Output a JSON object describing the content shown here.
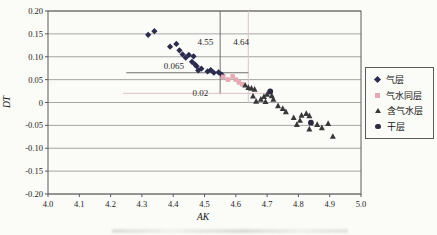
{
  "chart_data": {
    "type": "scatter",
    "title": "",
    "xlabel": "AK",
    "ylabel": "DT",
    "xlim": [
      4.0,
      5.0
    ],
    "ylim": [
      -0.2,
      0.2
    ],
    "grid": "horizontal-only",
    "legend_position": "right-outside-middle",
    "colors": {
      "grid": "#8f8f8f",
      "axis": "#5a5a5a",
      "background": "#fbfbf8"
    },
    "xticks": [
      {
        "v": 4.0,
        "label": "4.0"
      },
      {
        "v": 4.1,
        "label": "4.1"
      },
      {
        "v": 4.2,
        "label": "4.2"
      },
      {
        "v": 4.3,
        "label": "4.3"
      },
      {
        "v": 4.4,
        "label": "4.4"
      },
      {
        "v": 4.5,
        "label": "4.5"
      },
      {
        "v": 4.6,
        "label": "4.6"
      },
      {
        "v": 4.7,
        "label": "4.7"
      },
      {
        "v": 4.8,
        "label": "4.8"
      },
      {
        "v": 4.9,
        "label": "4.9"
      },
      {
        "v": 5.0,
        "label": "5.0"
      }
    ],
    "yticks": [
      {
        "v": 0.2,
        "label": "0.20"
      },
      {
        "v": 0.15,
        "label": "0.15"
      },
      {
        "v": 0.1,
        "label": "0.10"
      },
      {
        "v": 0.05,
        "label": "0.05"
      },
      {
        "v": 0,
        "label": "0"
      },
      {
        "v": -0.05,
        "label": "-0.05"
      },
      {
        "v": -0.1,
        "label": "-0.10"
      },
      {
        "v": -0.15,
        "label": "-0.15"
      },
      {
        "v": -0.2,
        "label": "-0.20"
      }
    ],
    "series": [
      {
        "key": "gas-layer",
        "name": "气层",
        "marker": "diamond",
        "color": "#2b2b4e",
        "points": [
          [
            4.32,
            0.148
          ],
          [
            4.34,
            0.156
          ],
          [
            4.39,
            0.122
          ],
          [
            4.41,
            0.128
          ],
          [
            4.42,
            0.114
          ],
          [
            4.43,
            0.105
          ],
          [
            4.44,
            0.098
          ],
          [
            4.45,
            0.104
          ],
          [
            4.46,
            0.089
          ],
          [
            4.465,
            0.101
          ],
          [
            4.47,
            0.083
          ],
          [
            4.475,
            0.079
          ],
          [
            4.48,
            0.07
          ],
          [
            4.49,
            0.074
          ],
          [
            4.51,
            0.068
          ],
          [
            4.52,
            0.071
          ],
          [
            4.53,
            0.065
          ],
          [
            4.545,
            0.066
          ],
          [
            4.555,
            0.061
          ]
        ]
      },
      {
        "key": "gas-water-same-layer",
        "name": "气水同层",
        "marker": "square",
        "color": "#e5aab1",
        "points": [
          [
            4.56,
            0.056
          ],
          [
            4.575,
            0.05
          ],
          [
            4.59,
            0.057
          ],
          [
            4.6,
            0.05
          ],
          [
            4.61,
            0.044
          ],
          [
            4.62,
            0.04
          ]
        ]
      },
      {
        "key": "gas-bearing-water-layer",
        "name": "含气水层",
        "marker": "triangle",
        "color": "#38383a",
        "points": [
          [
            4.63,
            0.038
          ],
          [
            4.64,
            0.033
          ],
          [
            4.65,
            0.031
          ],
          [
            4.66,
            0.029
          ],
          [
            4.655,
            0.014
          ],
          [
            4.665,
            0.003
          ],
          [
            4.68,
            0.007
          ],
          [
            4.69,
            0.013
          ],
          [
            4.695,
            0.002
          ],
          [
            4.7,
            0.018
          ],
          [
            4.715,
            0.015
          ],
          [
            4.72,
            0.007
          ],
          [
            4.735,
            -0.007
          ],
          [
            4.75,
            -0.013
          ],
          [
            4.76,
            -0.02
          ],
          [
            4.785,
            -0.033
          ],
          [
            4.795,
            -0.048
          ],
          [
            4.805,
            -0.039
          ],
          [
            4.81,
            -0.028
          ],
          [
            4.825,
            -0.024
          ],
          [
            4.835,
            -0.029
          ],
          [
            4.835,
            -0.058
          ],
          [
            4.86,
            -0.048
          ],
          [
            4.875,
            -0.055
          ],
          [
            4.895,
            -0.046
          ],
          [
            4.91,
            -0.074
          ]
        ]
      },
      {
        "key": "dry-layer",
        "name": "干层",
        "marker": "circle",
        "color": "#2e2a40",
        "points": [
          [
            4.71,
            0.024
          ],
          [
            4.84,
            -0.044
          ]
        ]
      }
    ],
    "annotations": {
      "vlines": [
        {
          "x": 4.55,
          "y_from": 0.018,
          "y_to": 0.2,
          "color": "#6f6f6f",
          "width": 1
        },
        {
          "x": 4.64,
          "y_from": 0.0,
          "y_to": 0.2,
          "color": "#dcc2c6",
          "width": 1
        }
      ],
      "hlines": [
        {
          "y": 0.065,
          "x_from": 4.25,
          "x_to": 4.64,
          "color": "#6f6f6f",
          "width": 1
        },
        {
          "y": 0.02,
          "x_from": 4.24,
          "x_to": 4.7,
          "color": "#dcc2c6",
          "width": 1
        }
      ],
      "labels": [
        {
          "text": "4.55",
          "x": 4.503,
          "y": 0.132
        },
        {
          "text": "4.64",
          "x": 4.617,
          "y": 0.132
        },
        {
          "text": "0.065",
          "x": 4.402,
          "y": 0.079
        },
        {
          "text": "0.02",
          "x": 4.487,
          "y": 0.021
        }
      ]
    }
  }
}
